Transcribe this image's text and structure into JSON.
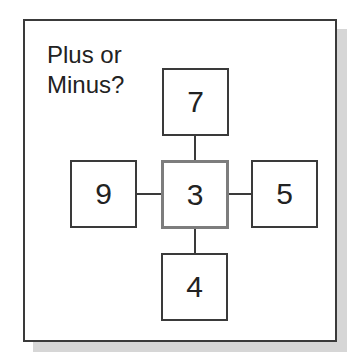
{
  "title": {
    "line1": "Plus or",
    "line2": "Minus?"
  },
  "boxes": {
    "top": "7",
    "left": "9",
    "center": "3",
    "right": "5",
    "bottom": "4"
  },
  "colors": {
    "border": "#3a3a3a",
    "center_border": "#7d7d7d",
    "shadow": "#d6d6d6"
  }
}
